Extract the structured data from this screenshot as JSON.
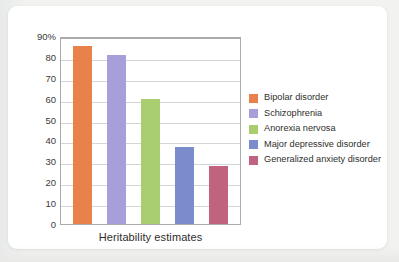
{
  "chart_data": {
    "type": "bar",
    "title": "",
    "xlabel": "Heritability estimates",
    "ylabel": "",
    "categories": [
      "Bipolar disorder",
      "Schizophrenia",
      "Anorexia nervosa",
      "Major depressive disorder",
      "Generalized anxiety disorder"
    ],
    "values": [
      85,
      81,
      60,
      37,
      28
    ],
    "ylim": [
      0,
      90
    ],
    "yticks": [
      "0",
      "10",
      "20",
      "30",
      "40",
      "50",
      "60",
      "70",
      "80",
      "90%"
    ],
    "ytick_values": [
      0,
      10,
      20,
      30,
      40,
      50,
      60,
      70,
      80,
      90
    ],
    "grid": true,
    "legend_position": "right",
    "colors": [
      "#e8814a",
      "#a79fda",
      "#a9ce6f",
      "#7a8ccb",
      "#c0637f"
    ]
  },
  "legend": {
    "items": [
      {
        "label": "Bipolar disorder",
        "color": "#e8814a"
      },
      {
        "label": "Schizophrenia",
        "color": "#a79fda"
      },
      {
        "label": "Anorexia nervosa",
        "color": "#a9ce6f"
      },
      {
        "label": "Major depressive disorder",
        "color": "#7a8ccb"
      },
      {
        "label": "Generalized anxiety disorder",
        "color": "#c0637f"
      }
    ]
  }
}
